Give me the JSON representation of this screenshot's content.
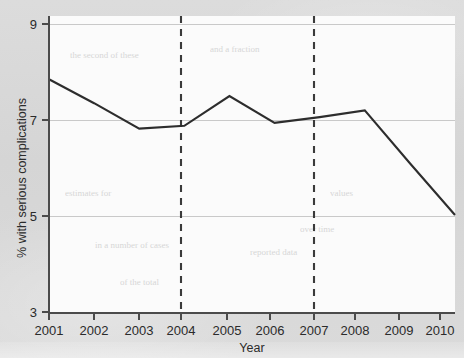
{
  "chart_data": {
    "type": "line",
    "title": "",
    "subtitle": "",
    "xlabel": "Year",
    "ylabel": "% with serious complications",
    "x": [
      2001,
      2002,
      2003,
      2004,
      2005,
      2006,
      2007,
      2008,
      2009,
      2010
    ],
    "xtick_labels": [
      "2001",
      "2002",
      "2003",
      "2004",
      "2005",
      "2006",
      "2007",
      "2008",
      "2009",
      "2010"
    ],
    "ytick_labels": [
      "3",
      "5",
      "7",
      "9"
    ],
    "yticks": [
      3,
      5,
      7,
      9
    ],
    "xlim": [
      2001,
      2010
    ],
    "ylim": [
      3,
      9
    ],
    "grid": "horizontal",
    "legend": "none",
    "series": [
      {
        "name": "% with serious complications",
        "color": "#2d2d2d",
        "values": [
          7.85,
          7.35,
          6.82,
          6.88,
          7.5,
          6.94,
          7.06,
          7.2,
          6.1,
          5.02
        ]
      }
    ],
    "reference_lines": [
      {
        "name": "vertical-dashed-2004",
        "x": 2004,
        "style": "dashed",
        "color": "#3a3a3a"
      },
      {
        "name": "vertical-dashed-2007",
        "x": 2007,
        "style": "dashed",
        "color": "#3a3a3a"
      }
    ],
    "colors": {
      "page_background": "#d6d6d6",
      "plot_background": "#fbfbfb",
      "axis": "#4b4b4b",
      "gridline": "#c9c9c9",
      "series": "#2d2d2d",
      "reference_line": "#3a3a3a"
    }
  }
}
